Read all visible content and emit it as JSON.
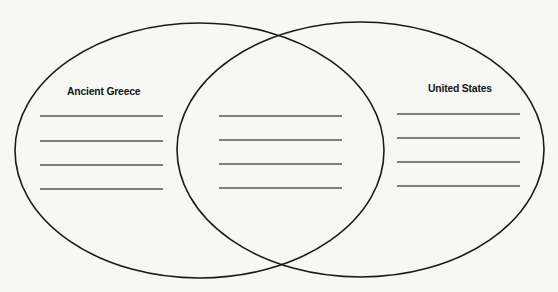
{
  "diagram": {
    "type": "venn",
    "top_fragment": "",
    "sets": [
      {
        "id": "left",
        "label": "Ancient Greece",
        "answer_lines": 4
      },
      {
        "id": "overlap",
        "label": "",
        "answer_lines": 4
      },
      {
        "id": "right",
        "label": "United States",
        "answer_lines": 4
      }
    ],
    "colors": {
      "outline": "#1a1a1a",
      "line": "#555555",
      "background": "#f7f7f5"
    }
  }
}
